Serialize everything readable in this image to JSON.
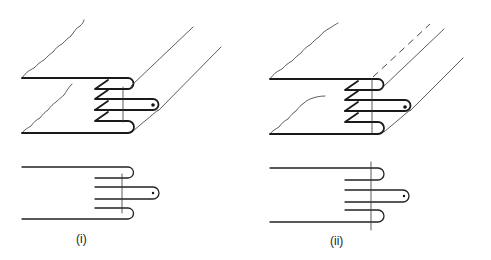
{
  "figure": {
    "panels": [
      {
        "id": "i",
        "label": "(i)",
        "views": [
          "isometric-knuckle-joint",
          "cross-section"
        ],
        "knuckle_layers": 5,
        "section_line": "inside knuckle bends",
        "hidden_edge_dashed": false
      },
      {
        "id": "ii",
        "label": "(ii)",
        "views": [
          "isometric-knuckle-joint",
          "cross-section"
        ],
        "knuckle_layers": 5,
        "section_line": "through knuckle bends, extended beyond plates",
        "hidden_edge_dashed": true
      }
    ],
    "colors": {
      "line": "#1a1a1a",
      "background": "#ffffff"
    }
  }
}
